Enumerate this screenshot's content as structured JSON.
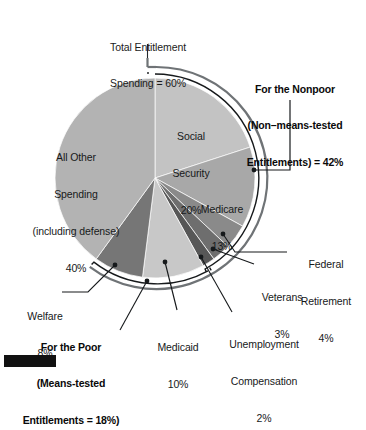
{
  "figure": {
    "title_note": "Total Entitlement Spending = 60%",
    "background": "#ffffff",
    "text_color": "#1b1b1b"
  },
  "chart_data": {
    "type": "pie",
    "title": "Total Entitlement Spending = 60%",
    "xlabel": "",
    "ylabel": "",
    "units": "percent of federal spending",
    "start_angle_deg": 0,
    "direction": "clockwise",
    "legend": "none (direct labels)",
    "grid": false,
    "categories": [
      "Social Security",
      "Medicare",
      "Federal Retirement",
      "Veterans",
      "Unemployment Compensation",
      "Medicaid",
      "Welfare",
      "All Other Spending (including defense)"
    ],
    "values": [
      20,
      13,
      4,
      3,
      2,
      10,
      8,
      40
    ],
    "colors": [
      "#c3c3c3",
      "#a8a8a8",
      "#8a8a8a",
      "#6e6e6e",
      "#575757",
      "#c8c8c8",
      "#767676",
      "#b3b3b3"
    ],
    "slices": [
      {
        "label": "Social Security",
        "value": 20,
        "value_text": "20%",
        "color": "#c3c3c3",
        "group": "nonpoor"
      },
      {
        "label": "Medicare",
        "value": 13,
        "value_text": "13%",
        "color": "#a8a8a8",
        "group": "nonpoor"
      },
      {
        "label": "Federal Retirement",
        "value": 4,
        "value_text": "4%",
        "color": "#8a8a8a",
        "group": "nonpoor"
      },
      {
        "label": "Veterans",
        "value": 3,
        "value_text": "3%",
        "color": "#6e6e6e",
        "group": "nonpoor"
      },
      {
        "label": "Unemployment Compensation",
        "value": 2,
        "value_text": "2%",
        "color": "#575757",
        "group": "nonpoor"
      },
      {
        "label": "Medicaid",
        "value": 10,
        "value_text": "10%",
        "color": "#c8c8c8",
        "group": "poor"
      },
      {
        "label": "Welfare",
        "value": 8,
        "value_text": "8%",
        "color": "#767676",
        "group": "poor"
      },
      {
        "label": "All Other Spending (including defense)",
        "value": 40,
        "value_text": "40%",
        "color": "#b3b3b3",
        "group": "nonentitlement"
      }
    ],
    "annotations": [
      {
        "name": "total-entitlement",
        "text": "Total Entitlement Spending = 60%",
        "value": 60
      },
      {
        "name": "nonpoor-group",
        "text": "For the Nonpoor (Non–means-tested Entitlements) = 42%",
        "value": 42
      },
      {
        "name": "poor-group",
        "text": "For the Poor (Means-tested Entitlements = 18%)",
        "value": 18
      }
    ]
  },
  "labels": {
    "total_entitlement_line1": "Total Entitlement",
    "total_entitlement_line2": "Spending = 60%",
    "nonpoor_line1": "For the Nonpoor",
    "nonpoor_line2": "(Non–means-tested",
    "nonpoor_line3": "Entitlements) = 42%",
    "poor_line1": "For the Poor",
    "poor_line2": "(Means-tested",
    "poor_line3": "Entitlements = 18%)",
    "social_security_name": "Social\nSecurity",
    "social_security_value": "20%",
    "medicare_name": "Medicare",
    "medicare_value": "13%",
    "all_other_line1": "All Other",
    "all_other_line2": "Spending",
    "all_other_line3": "(including defense)",
    "all_other_value": "40%",
    "federal_retirement_line1": "Federal",
    "federal_retirement_line2": "Retirement",
    "federal_retirement_value": "4%",
    "veterans_name": "Veterans",
    "veterans_value": "3%",
    "unemployment_line1": "Unemployment",
    "unemployment_line2": "Compensation",
    "unemployment_value": "2%",
    "medicaid_name": "Medicaid",
    "medicaid_value": "10%",
    "welfare_name": "Welfare",
    "welfare_value": "8%"
  }
}
